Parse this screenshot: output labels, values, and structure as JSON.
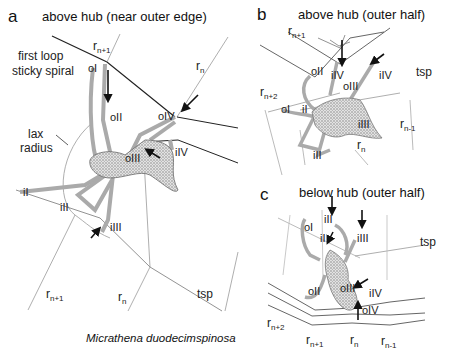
{
  "figure": {
    "caption_species": "Micrathena duodecimspinosa",
    "panels": [
      {
        "letter": "a",
        "title": "above hub (near outer edge)",
        "labels": {
          "first_loop": "first loop",
          "sticky_spiral": "sticky spiral",
          "lax": "lax",
          "radius": "radius",
          "rn1": "r",
          "rn1_sub": "n+1",
          "rn": "r",
          "rn_sub": "n",
          "rn1_bottom": "r",
          "rn1_bottom_sub": "n+1",
          "rn_bottom": "r",
          "rn_bottom_sub": "n",
          "tsp": "tsp",
          "oI": "oI",
          "oII": "oII",
          "oIII": "oIII",
          "oIV": "oIV",
          "iI": "iI",
          "iII": "iII",
          "iIII": "iIII",
          "iIV": "iIV"
        }
      },
      {
        "letter": "b",
        "title": "above hub (outer half)",
        "labels": {
          "rn1": "r",
          "rn1_sub": "n+1",
          "rn2": "r",
          "rn2_sub": "n+2",
          "rn": "r",
          "rn_sub": "n",
          "rnm1": "r",
          "rnm1_sub": "n-1",
          "tsp": "tsp",
          "oI": "oI",
          "oII": "oII",
          "oIII": "oIII",
          "iI": "iI",
          "iII": "iII",
          "iIII": "iIII",
          "iIV_left": "iIV",
          "iIV_right": "iIV"
        }
      },
      {
        "letter": "c",
        "title": "below hub (outer half)",
        "labels": {
          "rn2": "r",
          "rn2_sub": "n+2",
          "rn1": "r",
          "rn1_sub": "n+1",
          "rn": "r",
          "rn_sub": "n",
          "rnm1": "r",
          "rnm1_sub": "n-1",
          "tsp": "tsp",
          "oI": "oI",
          "oII": "oII",
          "oIII": "oIII",
          "oIV": "oIV",
          "iI": "iI",
          "iII": "iII",
          "iIII": "iIII",
          "iIV": "iIV"
        }
      }
    ]
  }
}
